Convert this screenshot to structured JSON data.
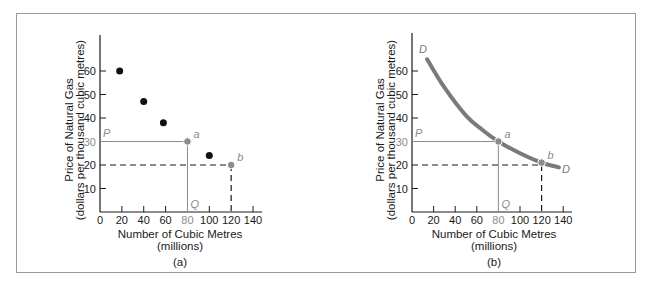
{
  "colors": {
    "ink": "#1a1a1a",
    "highlight": "#8c8c8c",
    "curve": "#7a7a7a"
  },
  "chart_data": [
    {
      "type": "scatter",
      "panel_label": "(a)",
      "xlabel": "Number of Cubic Metres",
      "xlabel_sub": "(millions)",
      "ylabel": "Price of Natural Gas",
      "ylabel_sub": "(dollars per thousand cubic metres)",
      "xlim": [
        0,
        140
      ],
      "ylim": [
        0,
        70
      ],
      "xticks": [
        0,
        20,
        40,
        60,
        80,
        100,
        120,
        140
      ],
      "yticks": [
        10,
        20,
        30,
        40,
        50,
        60
      ],
      "highlight_xtick": 80,
      "highlight_ytick": 30,
      "points": [
        {
          "x": 18,
          "y": 60
        },
        {
          "x": 40,
          "y": 47
        },
        {
          "x": 58,
          "y": 38
        },
        {
          "x": 100,
          "y": 24
        }
      ],
      "marked_points": [
        {
          "label": "a",
          "x": 80,
          "y": 30,
          "guide": "solid"
        },
        {
          "label": "b",
          "x": 120,
          "y": 20,
          "guide": "dashed"
        }
      ],
      "annotations": {
        "price": "P",
        "quantity": "Q"
      },
      "grid": false
    },
    {
      "type": "line",
      "panel_label": "(b)",
      "xlabel": "Number of Cubic Metres",
      "xlabel_sub": "(millions)",
      "ylabel": "Price of Natural Gas",
      "ylabel_sub": "(dollars per thousand cubic metres)",
      "xlim": [
        0,
        140
      ],
      "ylim": [
        0,
        70
      ],
      "xticks": [
        0,
        20,
        40,
        60,
        80,
        100,
        120,
        140
      ],
      "yticks": [
        10,
        20,
        30,
        40,
        50,
        60
      ],
      "highlight_xtick": 80,
      "highlight_ytick": 30,
      "series": [
        {
          "name": "D",
          "x": [
            14,
            30,
            50,
            65,
            80,
            100,
            120,
            136
          ],
          "y": [
            65,
            53,
            41,
            35,
            30,
            25,
            21,
            19
          ]
        }
      ],
      "curve_labels": {
        "start": "D",
        "end": "D"
      },
      "marked_points": [
        {
          "label": "a",
          "x": 80,
          "y": 30,
          "guide": "solid"
        },
        {
          "label": "b",
          "x": 120,
          "y": 21,
          "guide": "dashed",
          "guide_y": 20
        }
      ],
      "annotations": {
        "price": "P",
        "quantity": "Q"
      },
      "grid": false
    }
  ]
}
